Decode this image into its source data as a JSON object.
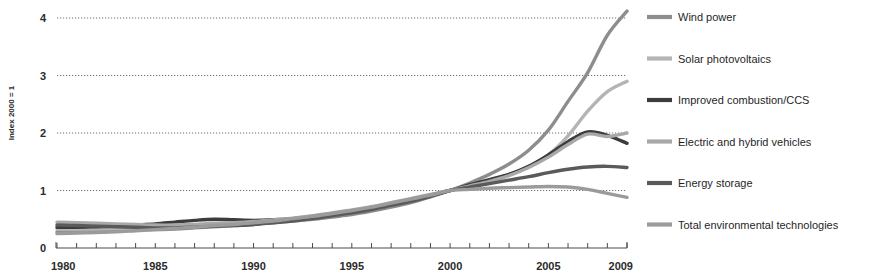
{
  "chart_data": {
    "type": "line",
    "title": "",
    "subtitle": "",
    "xlabel": "",
    "ylabel": "Index 2000 = 1",
    "xlim": [
      1980,
      2009
    ],
    "ylim": [
      0,
      4.4
    ],
    "grid": true,
    "grid_axis": "y",
    "legend_position": "right",
    "x_tick_labels": [
      "1980",
      "1985",
      "1990",
      "1995",
      "2000",
      "2005",
      "2009"
    ],
    "x_tick_values": [
      1980,
      1985,
      1990,
      1995,
      2000,
      2005,
      2009
    ],
    "x_minor_ticks_every": 1,
    "y_tick_labels": [
      "0",
      "1",
      "2",
      "3",
      "4"
    ],
    "y_tick_values": [
      0,
      1,
      2,
      3,
      4
    ],
    "x": [
      1980,
      1981,
      1982,
      1983,
      1984,
      1985,
      1986,
      1987,
      1988,
      1989,
      1990,
      1991,
      1992,
      1993,
      1994,
      1995,
      1996,
      1997,
      1998,
      1999,
      2000,
      2001,
      2002,
      2003,
      2004,
      2005,
      2006,
      2007,
      2008,
      2009
    ],
    "series": [
      {
        "name": "Wind power",
        "color": "#8d8d8d",
        "values": [
          0.28,
          0.28,
          0.29,
          0.3,
          0.31,
          0.32,
          0.33,
          0.35,
          0.37,
          0.39,
          0.41,
          0.44,
          0.47,
          0.5,
          0.54,
          0.58,
          0.64,
          0.71,
          0.79,
          0.89,
          1.0,
          1.13,
          1.28,
          1.46,
          1.7,
          2.05,
          2.55,
          3.05,
          3.7,
          4.12
        ]
      },
      {
        "name": "Solar photovoltaics",
        "color": "#b4b4b4",
        "values": [
          0.33,
          0.33,
          0.33,
          0.34,
          0.34,
          0.35,
          0.36,
          0.38,
          0.4,
          0.42,
          0.45,
          0.48,
          0.51,
          0.55,
          0.6,
          0.65,
          0.71,
          0.77,
          0.84,
          0.92,
          1.0,
          1.09,
          1.18,
          1.28,
          1.42,
          1.62,
          1.95,
          2.38,
          2.72,
          2.9
        ]
      },
      {
        "name": "Improved combustion/CCS",
        "color": "#3c3c3c",
        "values": [
          0.36,
          0.36,
          0.37,
          0.38,
          0.4,
          0.42,
          0.45,
          0.48,
          0.5,
          0.49,
          0.48,
          0.49,
          0.51,
          0.54,
          0.58,
          0.63,
          0.69,
          0.76,
          0.83,
          0.91,
          1.0,
          1.1,
          1.19,
          1.28,
          1.42,
          1.62,
          1.85,
          2.02,
          1.96,
          1.82
        ]
      },
      {
        "name": "Electric and hybrid vehicles",
        "color": "#a8a8a8",
        "values": [
          0.45,
          0.44,
          0.43,
          0.42,
          0.41,
          0.4,
          0.4,
          0.41,
          0.43,
          0.44,
          0.46,
          0.49,
          0.52,
          0.56,
          0.61,
          0.66,
          0.72,
          0.79,
          0.86,
          0.93,
          1.0,
          1.08,
          1.16,
          1.26,
          1.4,
          1.58,
          1.8,
          1.98,
          1.94,
          2.0
        ]
      },
      {
        "name": "Energy storage",
        "color": "#5a5a5a",
        "values": [
          0.4,
          0.39,
          0.38,
          0.37,
          0.36,
          0.35,
          0.35,
          0.36,
          0.38,
          0.39,
          0.41,
          0.44,
          0.47,
          0.51,
          0.56,
          0.61,
          0.67,
          0.74,
          0.81,
          0.9,
          1.0,
          1.06,
          1.12,
          1.18,
          1.24,
          1.31,
          1.37,
          1.41,
          1.42,
          1.4
        ]
      },
      {
        "name": "Total environmental technologies",
        "color": "#9b9b9b",
        "values": [
          0.25,
          0.26,
          0.27,
          0.28,
          0.3,
          0.32,
          0.34,
          0.36,
          0.39,
          0.41,
          0.44,
          0.47,
          0.51,
          0.55,
          0.6,
          0.65,
          0.71,
          0.78,
          0.85,
          0.92,
          1.0,
          1.02,
          1.04,
          1.05,
          1.06,
          1.07,
          1.06,
          1.02,
          0.95,
          0.88
        ]
      }
    ]
  },
  "legend": {
    "items": [
      {
        "label": "Wind power"
      },
      {
        "label": "Solar photovoltaics"
      },
      {
        "label": "Improved combustion/CCS"
      },
      {
        "label": "Electric and hybrid vehicles"
      },
      {
        "label": "Energy storage"
      },
      {
        "label": "Total environmental technologies"
      }
    ]
  },
  "colors": {
    "grid": "#6f6f6f",
    "axis": "#4a4a4a",
    "text": "#1f1f1f",
    "background": "#ffffff"
  }
}
